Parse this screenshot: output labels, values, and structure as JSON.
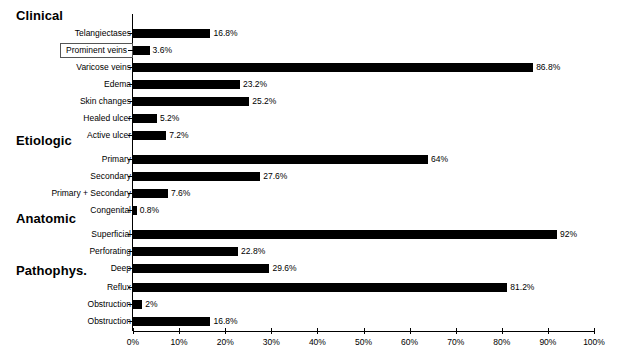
{
  "chart_data": {
    "type": "bar",
    "orientation": "horizontal",
    "title": "",
    "xlabel": "",
    "ylabel": "",
    "xlim": [
      0,
      100
    ],
    "grid": false,
    "legend": null,
    "xtick_labels": [
      "0%",
      "10%",
      "20%",
      "30%",
      "40%",
      "50%",
      "60%",
      "70%",
      "80%",
      "90%",
      "100%"
    ],
    "xtick_values": [
      0,
      10,
      20,
      30,
      40,
      50,
      60,
      70,
      80,
      90,
      100
    ],
    "bar_color": "#000000",
    "sections": [
      {
        "heading": "Clinical",
        "categories": [
          "Telangiectases",
          "Prominent veins",
          "Varicose veins",
          "Edema",
          "Skin changes",
          "Healed ulcer",
          "Active ulcer"
        ],
        "values": [
          16.8,
          3.6,
          86.8,
          23.2,
          25.2,
          5.2,
          7.2
        ],
        "value_labels": [
          "16.8%",
          "3.6%",
          "86.8%",
          "23.2%",
          "25.2%",
          "5.2%",
          "7.2%"
        ],
        "highlighted": [
          "Prominent veins"
        ]
      },
      {
        "heading": "Etiologic",
        "categories": [
          "Primary",
          "Secondary",
          "Primary + Secondary",
          "Congenital"
        ],
        "values": [
          64,
          27.6,
          7.6,
          0.8
        ],
        "value_labels": [
          "64%",
          "27.6%",
          "7.6%",
          "0.8%"
        ],
        "highlighted": []
      },
      {
        "heading": "Anatomic",
        "categories": [
          "Superficial",
          "Perforating",
          "Deep"
        ],
        "values": [
          92,
          22.8,
          29.6
        ],
        "value_labels": [
          "92%",
          "22.8%",
          "29.6%"
        ],
        "highlighted": []
      },
      {
        "heading": "Pathophys.",
        "categories": [
          "Reflux",
          "Obstruction",
          "Obstruction"
        ],
        "values": [
          81.2,
          2,
          16.8
        ],
        "value_labels": [
          "81.2%",
          "2%",
          "16.8%"
        ],
        "highlighted": []
      }
    ]
  }
}
